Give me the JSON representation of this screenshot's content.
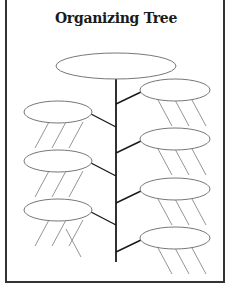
{
  "worksheet": {
    "title": "Organizing Tree",
    "colors": {
      "line": "#1a1a1a",
      "ellipse_stroke": "#777777",
      "leaf_stroke": "#888888",
      "frame": "#333333"
    },
    "top_node": {
      "cx": 116,
      "cy": 66,
      "rx": 60,
      "ry": 13
    },
    "trunk": {
      "x": 116,
      "y1": 79,
      "y2": 262
    },
    "branches": [
      {
        "side": "right",
        "cx": 175,
        "cy": 90,
        "rx": 35,
        "ry": 11,
        "attach_y": 104
      },
      {
        "side": "left",
        "cx": 58,
        "cy": 112,
        "rx": 34,
        "ry": 11,
        "attach_y": 127
      },
      {
        "side": "right",
        "cx": 175,
        "cy": 139,
        "rx": 35,
        "ry": 11,
        "attach_y": 153
      },
      {
        "side": "left",
        "cx": 58,
        "cy": 161,
        "rx": 34,
        "ry": 11,
        "attach_y": 176
      },
      {
        "side": "right",
        "cx": 175,
        "cy": 189,
        "rx": 35,
        "ry": 11,
        "attach_y": 203
      },
      {
        "side": "left",
        "cx": 58,
        "cy": 210,
        "rx": 34,
        "ry": 11,
        "attach_y": 225
      },
      {
        "side": "right",
        "cx": 175,
        "cy": 238,
        "rx": 35,
        "ry": 11,
        "attach_y": 252
      }
    ],
    "detail_lines_per_node": 3
  }
}
